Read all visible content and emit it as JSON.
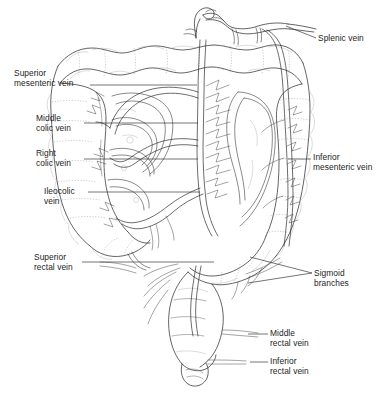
{
  "figure": {
    "style": "black-and-white anatomical line drawing",
    "background_color": "#ffffff",
    "ink_color": "#303030"
  },
  "labels": {
    "splenic_vein": "Splenic vein",
    "superior_mesenteric_vein": "Superior\nmesenteric vein",
    "middle_colic_vein": "Middle\ncolic vein",
    "right_colic_vein": "Right\ncolic vein",
    "ileocolic_vein": "Ileocolic\nvein",
    "inferior_mesenteric_vein": "Inferior\nmesenteric vein",
    "superior_rectal_vein": "Superior\nrectal vein",
    "sigmoid_branches": "Sigmoid\nbranches",
    "middle_rectal_vein": "Middle\nrectal vein",
    "inferior_rectal_vein": "Inferior\nrectal vein"
  },
  "label_positions": {
    "splenic_vein": {
      "x": 318,
      "y": 33,
      "side": "right"
    },
    "superior_mesenteric_vein": {
      "x": 14,
      "y": 68,
      "side": "left"
    },
    "middle_colic_vein": {
      "x": 36,
      "y": 113,
      "side": "left"
    },
    "right_colic_vein": {
      "x": 36,
      "y": 148,
      "side": "left"
    },
    "ileocolic_vein": {
      "x": 44,
      "y": 186,
      "side": "left"
    },
    "inferior_mesenteric_vein": {
      "x": 313,
      "y": 152,
      "side": "right"
    },
    "superior_rectal_vein": {
      "x": 34,
      "y": 252,
      "side": "left"
    },
    "sigmoid_branches": {
      "x": 314,
      "y": 268,
      "side": "right"
    },
    "middle_rectal_vein": {
      "x": 270,
      "y": 328,
      "side": "right"
    },
    "inferior_rectal_vein": {
      "x": 270,
      "y": 356,
      "side": "right"
    }
  },
  "structures": [
    "portal vein",
    "splenic vein",
    "superior mesenteric vein",
    "inferior mesenteric vein",
    "middle colic vein",
    "right colic vein",
    "ileocolic vein",
    "sigmoid branches",
    "superior rectal vein",
    "middle rectal vein",
    "inferior rectal vein",
    "transverse colon",
    "ascending colon",
    "descending colon",
    "sigmoid colon",
    "cecum",
    "rectum",
    "anal canal",
    "small intestine"
  ]
}
